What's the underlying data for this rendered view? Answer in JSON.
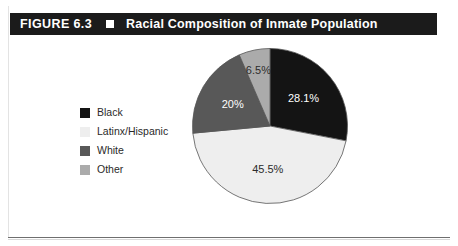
{
  "figure": {
    "number": "FIGURE 6.3",
    "marker": "black-square",
    "title": "Racial Composition of Inmate Population"
  },
  "legend": {
    "items": [
      {
        "label": "Black",
        "color": "#141414"
      },
      {
        "label": "Latinx/Hispanic",
        "color": "#eeeeee"
      },
      {
        "label": "White",
        "color": "#585858"
      },
      {
        "label": "Other",
        "color": "#ababab"
      }
    ]
  },
  "chart_data": {
    "type": "pie",
    "title": "Racial Composition of Inmate Population",
    "categories": [
      "Black",
      "Latinx/Hispanic",
      "White",
      "Other"
    ],
    "values": [
      28.1,
      45.5,
      20,
      6.5
    ],
    "labels": [
      "28.1%",
      "45.5%",
      "20%",
      "6.5%"
    ],
    "colors": [
      "#141414",
      "#eeeeee",
      "#585858",
      "#ababab"
    ],
    "label_text_colors": [
      "#ffffff",
      "#2b2b2b",
      "#ffffff",
      "#2b2b2b"
    ],
    "units": "percent",
    "start_angle_deg": 0,
    "direction": "clockwise",
    "legend_position": "left",
    "grid": false,
    "stroke": "#555555"
  }
}
